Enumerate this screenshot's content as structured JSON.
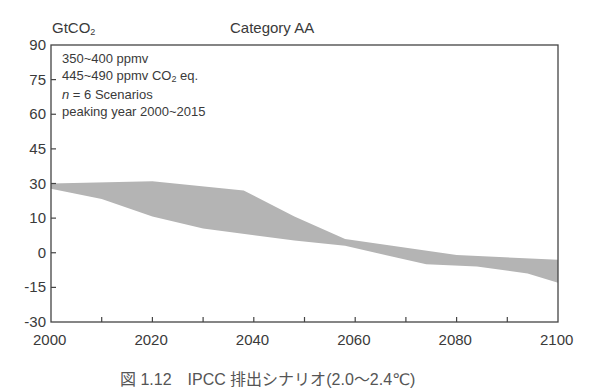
{
  "chart_data": {
    "type": "area",
    "title": "Category AA",
    "ylabel": "GtCO2",
    "xlabel": "",
    "x_ticks": [
      2000,
      2020,
      2040,
      2060,
      2080,
      2100
    ],
    "x_minor_ticks": [
      2010,
      2030,
      2050,
      2070,
      2090
    ],
    "y_ticks": [
      90,
      75,
      60,
      45,
      30,
      10,
      0,
      -15,
      -30
    ],
    "xlim": [
      2000,
      2100
    ],
    "ylim": [
      -30,
      90
    ],
    "grid": false,
    "annotations": [
      "350~400 ppmv",
      "445~490 ppmv CO2 eq.",
      "n = 6 Scenarios",
      "peaking year 2000~2015"
    ],
    "series": [
      {
        "name": "upper bound",
        "x": [
          2000,
          2020,
          2038,
          2048,
          2058,
          2080,
          2100
        ],
        "values": [
          30,
          31,
          26,
          11,
          4,
          -1,
          -3
        ]
      },
      {
        "name": "lower bound",
        "x": [
          2000,
          2010,
          2020,
          2030,
          2048,
          2058,
          2064,
          2074,
          2084,
          2094,
          2100
        ],
        "values": [
          27,
          21,
          11,
          7,
          3.5,
          2,
          0,
          -5,
          -6,
          -9,
          -13
        ]
      }
    ],
    "fill_color": "#b4b4b4"
  },
  "header": {
    "ylabel_text": "GtCO",
    "ylabel_sub": "2",
    "title": "Category AA"
  },
  "annotation": {
    "line1": "350~400 ppmv",
    "line2_pre": "445~490 ppmv CO",
    "line2_sub": "2",
    "line2_post": " eq.",
    "line3_italic": "n",
    "line3_rest": " = 6 Scenarios",
    "line4": "peaking year 2000~2015"
  },
  "caption": "図 1.12　IPCC 排出シナリオ(2.0～2.4℃)"
}
